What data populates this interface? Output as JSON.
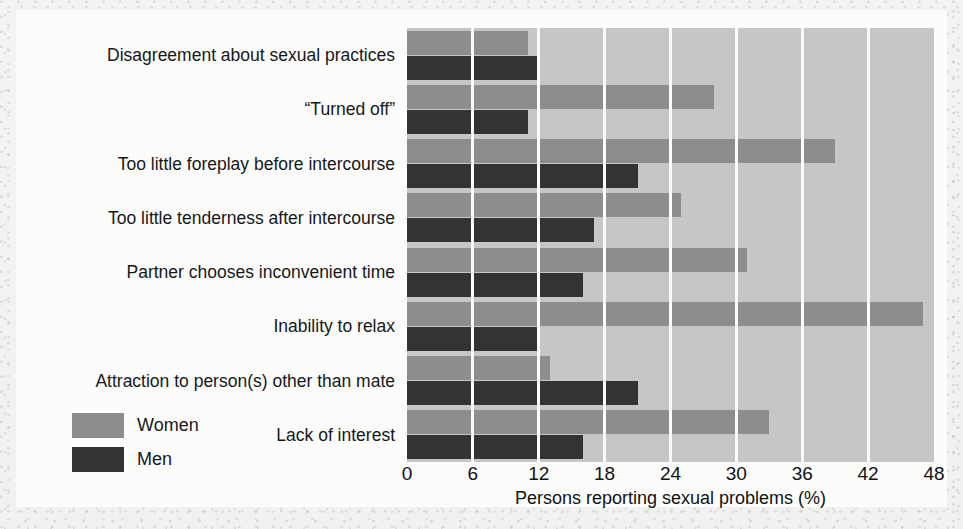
{
  "chart_data": {
    "type": "bar",
    "orientation": "horizontal",
    "title": "",
    "xlabel": "Persons reporting sexual problems (%)",
    "ylabel": "",
    "xlim": [
      0,
      48
    ],
    "xticks": [
      0,
      6,
      12,
      18,
      24,
      30,
      36,
      42,
      48
    ],
    "grid": true,
    "legend_position": "bottom-left",
    "categories": [
      "Disagreement about sexual practices",
      "“Turned off”",
      "Too little foreplay before intercourse",
      "Too little tenderness after intercourse",
      "Partner chooses inconvenient time",
      "Inability to relax",
      "Attraction to person(s) other than mate",
      "Lack of interest"
    ],
    "series": [
      {
        "name": "Women",
        "color": "#8d8d8d",
        "values": [
          11,
          28,
          39,
          25,
          31,
          47,
          13,
          33
        ]
      },
      {
        "name": "Men",
        "color": "#333333",
        "values": [
          12,
          11,
          21,
          17,
          16,
          12,
          21,
          16
        ]
      }
    ]
  },
  "legend": {
    "items": [
      {
        "label": "Women",
        "color": "#8d8d8d"
      },
      {
        "label": "Men",
        "color": "#333333"
      }
    ]
  },
  "axis": {
    "x_title": "Persons reporting sexual problems (%)",
    "x_ticks": [
      "0",
      "6",
      "12",
      "18",
      "24",
      "30",
      "36",
      "42",
      "48"
    ]
  },
  "colors": {
    "plot_background": "#c6c6c6",
    "gridline": "#fbfbfa",
    "women_bar": "#8d8d8d",
    "men_bar": "#333333",
    "page_background": "#fcfcfb",
    "text": "#16181a"
  }
}
